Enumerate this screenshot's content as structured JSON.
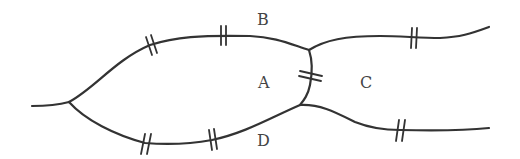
{
  "diagram": {
    "type": "konigsberg-bridges",
    "colors": {
      "line": "#333333",
      "text": "#444444",
      "background": "#ffffff"
    },
    "regions": [
      {
        "id": "A",
        "label": "A",
        "x": 258,
        "y": 75
      },
      {
        "id": "B",
        "label": "B",
        "x": 257,
        "y": 12
      },
      {
        "id": "C",
        "label": "C",
        "x": 360,
        "y": 75
      },
      {
        "id": "D",
        "label": "D",
        "x": 257,
        "y": 133
      }
    ],
    "bridges": [
      {
        "id": "bridge-1",
        "between": "A-B",
        "x": 152,
        "y": 44
      },
      {
        "id": "bridge-2",
        "between": "A-B",
        "x": 224,
        "y": 35
      },
      {
        "id": "bridge-3",
        "between": "A-D",
        "x": 144,
        "y": 143
      },
      {
        "id": "bridge-4",
        "between": "A-D",
        "x": 213,
        "y": 140
      },
      {
        "id": "bridge-5",
        "between": "A-C",
        "x": 311,
        "y": 77
      },
      {
        "id": "bridge-6",
        "between": "B-C",
        "x": 414,
        "y": 38
      },
      {
        "id": "bridge-7",
        "between": "C-D",
        "x": 400,
        "y": 130
      }
    ]
  }
}
